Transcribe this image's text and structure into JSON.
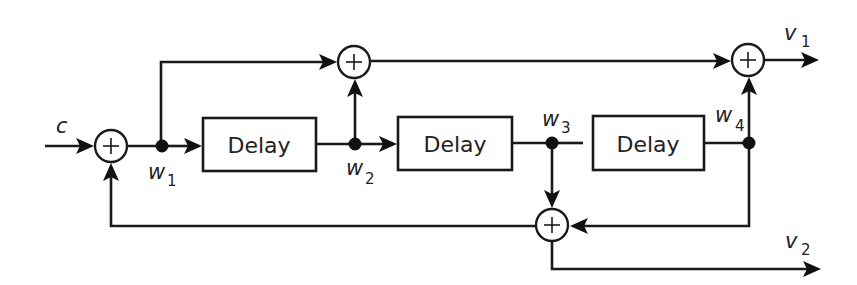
{
  "diagram": {
    "type": "block-diagram",
    "colors": {
      "line": "#1a1a1a",
      "background": "#ffffff"
    },
    "blocks": [
      {
        "id": "delay1",
        "label": "Delay"
      },
      {
        "id": "delay2",
        "label": "Delay"
      },
      {
        "id": "delay3",
        "label": "Delay"
      }
    ],
    "summers": [
      {
        "id": "sum-input",
        "symbol": "+"
      },
      {
        "id": "sum-top",
        "symbol": "+"
      },
      {
        "id": "sum-bottom",
        "symbol": "+"
      },
      {
        "id": "sum-output",
        "symbol": "+"
      }
    ],
    "signals": {
      "input": {
        "name": "c",
        "sub": ""
      },
      "w1": {
        "name": "w",
        "sub": "1"
      },
      "w2": {
        "name": "w",
        "sub": "2"
      },
      "w3": {
        "name": "w",
        "sub": "3"
      },
      "w4": {
        "name": "w",
        "sub": "4"
      },
      "v1": {
        "name": "v",
        "sub": "1"
      },
      "v2": {
        "name": "v",
        "sub": "2"
      }
    },
    "connections": [
      {
        "from": "c",
        "to": "sum-input"
      },
      {
        "from": "sum-input",
        "to": "w1"
      },
      {
        "from": "w1",
        "to": "delay1"
      },
      {
        "from": "w1",
        "to": "sum-top"
      },
      {
        "from": "delay1",
        "to": "w2"
      },
      {
        "from": "w2",
        "to": "sum-top"
      },
      {
        "from": "w2",
        "to": "delay2"
      },
      {
        "from": "delay2",
        "to": "w3"
      },
      {
        "from": "w3",
        "to": "delay3",
        "note": "line shown with gap, no arrowhead"
      },
      {
        "from": "w3",
        "to": "sum-bottom"
      },
      {
        "from": "delay3",
        "to": "w4"
      },
      {
        "from": "w4",
        "to": "sum-output"
      },
      {
        "from": "w4",
        "to": "sum-bottom"
      },
      {
        "from": "sum-top",
        "to": "sum-output"
      },
      {
        "from": "sum-output",
        "to": "v1"
      },
      {
        "from": "sum-bottom",
        "to": "sum-input",
        "note": "feedback"
      },
      {
        "from": "sum-bottom",
        "to": "v2"
      }
    ]
  }
}
